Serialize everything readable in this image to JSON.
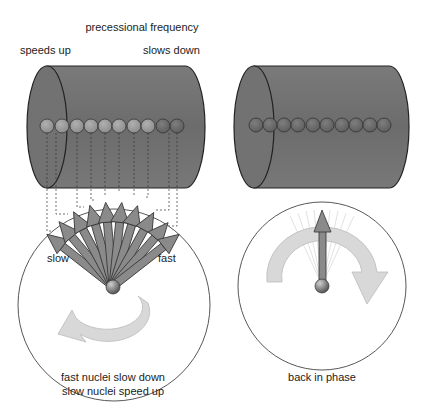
{
  "labels": {
    "title": "precessional frequency",
    "left_top": "speeds up",
    "right_top": "slows down",
    "slow": "slow",
    "fast": "fast",
    "caption_left_line1": "fast nuclei slow down",
    "caption_left_line2": "slow nuclei speed up",
    "caption_right": "back in phase"
  },
  "colors": {
    "cylinder": "#6f6f6f",
    "cylinder_cap": "#7a7a7a",
    "sphere_light": "#9a9a9a",
    "sphere_dark": "#6a6a6a",
    "arrow": "#8a8a8a",
    "curved_arrow": "#d6d6d6",
    "outline": "#222222"
  },
  "left_panel": {
    "sphere_count": 10,
    "arrow_count": 10
  },
  "right_panel": {
    "sphere_count": 10
  }
}
